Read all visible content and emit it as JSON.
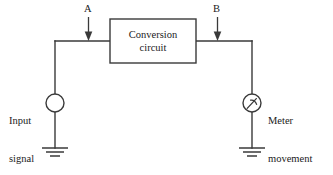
{
  "diagram": {
    "background_color": "#ffffff",
    "line_color": "#3a3a3a",
    "text_color": "#1a1a1a"
  },
  "block": {
    "label_line1": "Conversion",
    "label_line2": "circuit"
  },
  "test_points": {
    "point_a": "A",
    "point_b": "B"
  },
  "source": {
    "label_line1": "Input",
    "label_line2": "signal",
    "symbol": "source-circle-icon"
  },
  "meter": {
    "label_line1": "Meter",
    "label_line2": "movement",
    "symbol": "meter-movement-icon"
  },
  "grounds": {
    "left": "ground-symbol-icon",
    "right": "ground-symbol-icon"
  }
}
